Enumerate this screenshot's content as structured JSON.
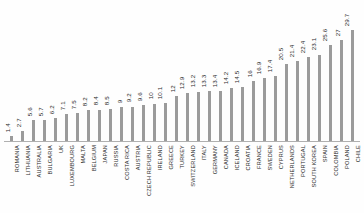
{
  "chart_data": {
    "type": "bar",
    "title": "",
    "subtitle": "",
    "xlabel": "",
    "ylabel": "",
    "orientation": "vertical",
    "grid": false,
    "legend": null,
    "legend_position": "none",
    "value_labels_shown": true,
    "value_label_rotation": "vertical",
    "category_label_rotation": "vertical",
    "axis_ticks_shown": false,
    "ylim": [
      0,
      29.7
    ],
    "bar_color": "#9b9b9b",
    "background_color": "#fefefe",
    "axis_color": "#b0b0b0",
    "text_color": "#2b2b2b",
    "categories": [
      "ROMANIA",
      "LITHUANIA",
      "AUSTRALIA",
      "BULGARIA",
      "UK",
      "LUXEMBOURG",
      "MALTA",
      "BELGIUM",
      "JAPAN",
      "RUSSIA",
      "COSTA RICA",
      "AUSTRIA",
      "CZECH REPUBLIC",
      "IRELAND",
      "GREECE",
      "TURKEY",
      "SWITZERLAND",
      "ITALY",
      "GERMANY",
      "CANADA",
      "ICELAND",
      "CROATIA",
      "FRANCE",
      "SWEDEN",
      "CYPRUS",
      "NETHERLANDS",
      "PORTUGAL",
      "SOUTH KOREA",
      "SPAIN",
      "COLOMBIA",
      "POLAND",
      "CHILE"
    ],
    "values": [
      1.4,
      2.7,
      5.6,
      5.7,
      6.2,
      7.1,
      7.5,
      8.2,
      8.4,
      8.5,
      9,
      9.2,
      9.6,
      10,
      10.1,
      12,
      12.9,
      13.2,
      13.3,
      13.4,
      14.2,
      14.5,
      16,
      16.9,
      17.4,
      20.5,
      21.4,
      22.4,
      23.1,
      25.6,
      27,
      29.7
    ],
    "value_labels": [
      "1.4",
      "2.7",
      "5.6",
      "5.7",
      "6.2",
      "7.1",
      "7.5",
      "8.2",
      "8.4",
      "8.5",
      "9",
      "9.2",
      "9.6",
      "10",
      "10.1",
      "12",
      "12.9",
      "13.2",
      "13.3",
      "13.4",
      "14.2",
      "14.5",
      "16",
      "16.9",
      "17.4",
      "20.5",
      "21.4",
      "22.4",
      "23.1",
      "25.6",
      "27",
      "29.7"
    ]
  }
}
